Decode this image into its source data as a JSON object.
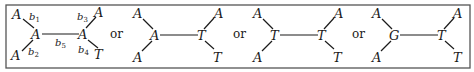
{
  "figure": {
    "separator": "or",
    "colors": {
      "ink": "#1a1a1a",
      "frame": "#555555",
      "background": "#ffffff"
    },
    "trees": [
      {
        "leaves": {
          "top_left": "A",
          "bottom_left": "A",
          "top_right": "A",
          "bottom_right": "T"
        },
        "internal": {
          "left": "A",
          "right": "A"
        },
        "branch_labels": {
          "b1": {
            "base": "b",
            "sub": "1"
          },
          "b2": {
            "base": "b",
            "sub": "2"
          },
          "b3": {
            "base": "b",
            "sub": "3"
          },
          "b4": {
            "base": "b",
            "sub": "4"
          },
          "b5": {
            "base": "b",
            "sub": "5"
          }
        }
      },
      {
        "leaves": {
          "top_left": "A",
          "bottom_left": "A",
          "top_right": "A",
          "bottom_right": "T"
        },
        "internal": {
          "left": "A",
          "right": "T"
        }
      },
      {
        "leaves": {
          "top_left": "A",
          "bottom_left": "A",
          "top_right": "A",
          "bottom_right": "T"
        },
        "internal": {
          "left": "T",
          "right": "T"
        }
      },
      {
        "leaves": {
          "top_left": "A",
          "bottom_left": "A",
          "top_right": "A",
          "bottom_right": "T"
        },
        "internal": {
          "left": "G",
          "right": "T"
        }
      }
    ]
  }
}
